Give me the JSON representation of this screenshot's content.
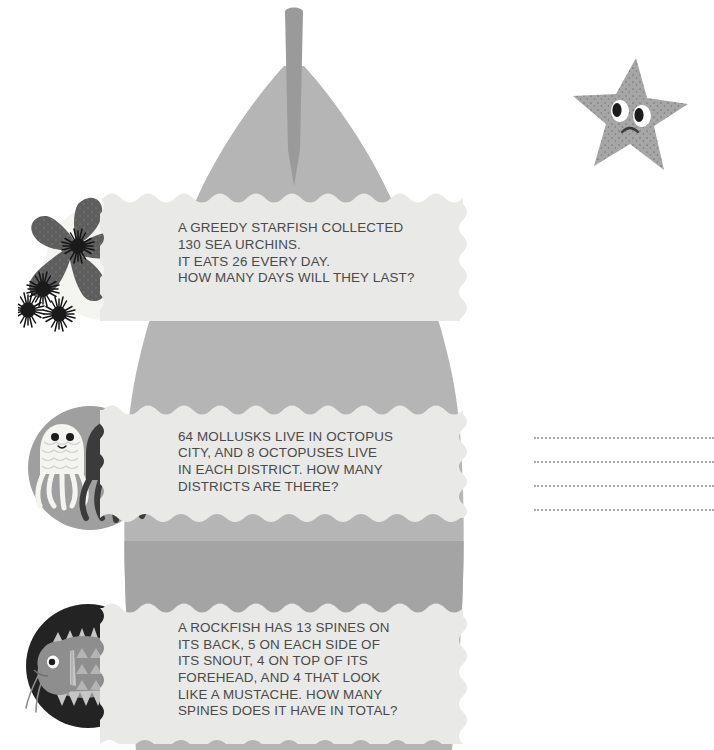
{
  "page": {
    "background_color": "#ffffff",
    "shape_color": "#b5b5b5",
    "shape_dark_color": "#9a9a9a",
    "banner_color": "#e9e9e7",
    "text_color": "#4a4a4a",
    "dot_color": "#a9a9a9"
  },
  "decor": {
    "shell_shape_name": "gray-shell-silhouette",
    "spire_name": "shell-spire",
    "corner_starfish": {
      "name": "sad-starfish-mascot",
      "body_color": "#a6a6a6",
      "speckle_color": "#6f6f6f"
    }
  },
  "problems": [
    {
      "id": "problem-1",
      "illustration": {
        "name": "starfish-with-sea-urchins-illustration",
        "circle_color": "#f2f2ef",
        "starfish_color": "#5e5e5e",
        "urchin_color": "#1f1f1f"
      },
      "text": "A GREEDY STARFISH COLLECTED\n130 SEA URCHINS.\nIT EATS 26 EVERY DAY.\nHOW MANY DAYS WILL THEY LAST?",
      "answer_lines": 4
    },
    {
      "id": "problem-2",
      "illustration": {
        "name": "two-octopuses-illustration",
        "circle_color": "#9f9f9f",
        "light_octopus_color": "#f4f4f1",
        "dark_octopus_color": "#3b3b3b"
      },
      "text": "64 MOLLUSKS LIVE IN OCTOPUS\nCITY, AND 8 OCTOPUSES LIVE\nIN EACH DISTRICT. HOW MANY\nDISTRICTS ARE THERE?",
      "answer_lines": 4
    },
    {
      "id": "problem-3",
      "illustration": {
        "name": "rockfish-illustration",
        "circle_color": "#232323",
        "fish_color": "#8e8e8e",
        "fin_color": "#c6c6c6"
      },
      "text": "A ROCKFISH HAS 13 SPINES ON\nITS BACK, 5 ON EACH SIDE OF\nITS SNOUT, 4 ON TOP OF ITS\nFOREHEAD, AND 4 THAT LOOK\nLIKE A MUSTACHE. HOW MANY\nSPINES DOES IT HAVE IN TOTAL?",
      "answer_lines": 4
    }
  ]
}
